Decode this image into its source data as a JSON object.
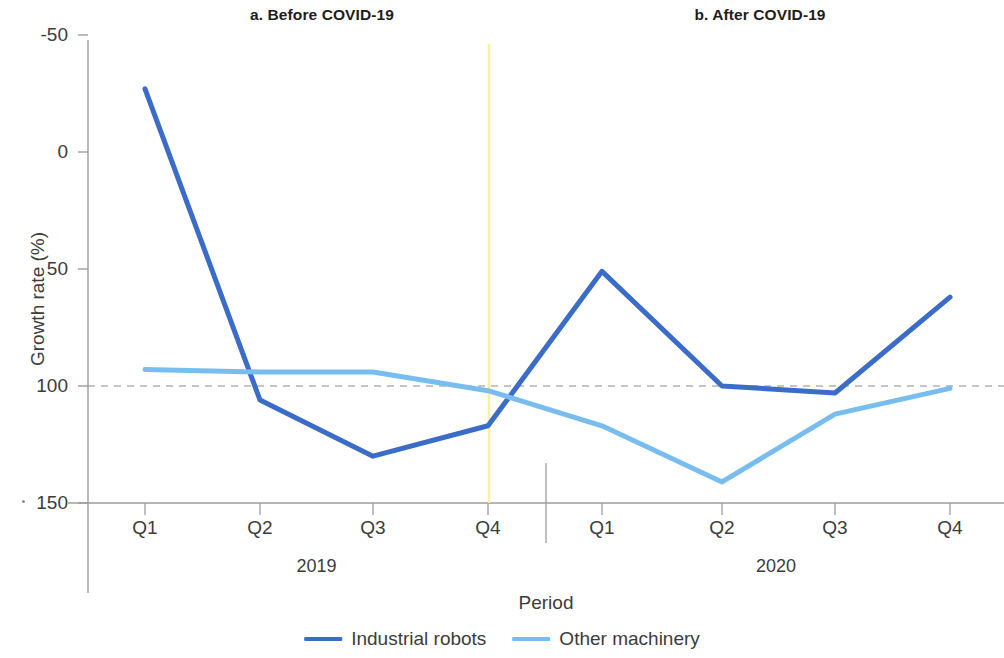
{
  "figure": {
    "panel_a_title": "a. Before COVID-19",
    "panel_b_title": "b. After COVID-19",
    "xlabel": "Period",
    "ylabel": "Growth rate (%)",
    "group_labels": [
      "2019",
      "2020"
    ]
  },
  "legend": {
    "items": [
      {
        "label": "Industrial robots",
        "color": "#3b6cc8"
      },
      {
        "label": "Other machinery",
        "color": "#79bdef"
      }
    ]
  },
  "colors": {
    "industrial_robots": "#3b6cc8",
    "other_machinery": "#79bdef",
    "axis": "#9d9d9c",
    "zero_line": "#8c8c8c",
    "covid_marker": "#f5f1a0",
    "text": "#3c3c3b"
  },
  "axis": {
    "y_ticks": [
      "150",
      "100",
      "50",
      "0",
      "-50"
    ],
    "x_ticks": [
      "Q1",
      "Q2",
      "Q3",
      "Q4",
      "Q1",
      "Q2",
      "Q3",
      "Q4"
    ]
  },
  "chart_data": {
    "type": "line",
    "title": "",
    "xlabel": "Period",
    "ylabel": "Growth rate (%)",
    "ylim": [
      -50,
      150
    ],
    "yticks": [
      -50,
      0,
      50,
      100,
      150
    ],
    "grid": false,
    "legend_position": "bottom",
    "panels": [
      {
        "name": "a. Before COVID-19",
        "group": "2019",
        "categories": [
          "Q1",
          "Q2",
          "Q3",
          "Q4"
        ]
      },
      {
        "name": "b. After COVID-19",
        "group": "2020",
        "categories": [
          "Q1",
          "Q2",
          "Q3",
          "Q4"
        ]
      }
    ],
    "categories": [
      "2019 Q1",
      "2019 Q2",
      "2019 Q3",
      "2019 Q4",
      "2020 Q1",
      "2020 Q2",
      "2020 Q3",
      "2020 Q4"
    ],
    "series": [
      {
        "name": "Industrial robots",
        "color": "#3b6cc8",
        "values": [
          127,
          -6,
          -30,
          -17,
          49,
          0,
          -3,
          38
        ]
      },
      {
        "name": "Other machinery",
        "color": "#79bdef",
        "values": [
          7,
          6,
          6,
          -2,
          -17,
          -41,
          -12,
          -1
        ]
      }
    ],
    "annotations": [
      {
        "type": "vline",
        "x": "2019 Q4",
        "color": "#f5f1a0",
        "note": "COVID-19 onset marker"
      },
      {
        "type": "hline",
        "y": 0,
        "style": "dashed",
        "color": "#8c8c8c"
      },
      {
        "type": "panel-divider",
        "between": [
          "2019 Q4",
          "2020 Q1"
        ]
      }
    ]
  }
}
